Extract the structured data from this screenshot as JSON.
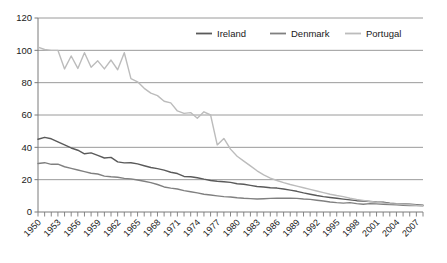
{
  "chart_data": {
    "type": "line",
    "title": "",
    "subtitle": "",
    "xlabel": "",
    "ylabel": "",
    "xlim": [
      1950,
      2008
    ],
    "ylim": [
      0,
      120
    ],
    "yticks": [
      0,
      20,
      40,
      60,
      80,
      100,
      120
    ],
    "ytick_labels": [
      "0",
      "20",
      "40",
      "60",
      "80",
      "100",
      "120"
    ],
    "xticks": [
      1950,
      1953,
      1956,
      1959,
      1962,
      1965,
      1968,
      1971,
      1974,
      1977,
      1980,
      1983,
      1986,
      1989,
      1992,
      1995,
      1998,
      2001,
      2004,
      2007
    ],
    "xtick_labels": [
      "1950",
      "1953",
      "1956",
      "1959",
      "1962",
      "1965",
      "1968",
      "1971",
      "1974",
      "1977",
      "1980",
      "1983",
      "1986",
      "1989",
      "1992",
      "1995",
      "1998",
      "2001",
      "2004",
      "2007"
    ],
    "xtick_minor_step": 1,
    "grid": "horizontal",
    "legend_position": "top-right",
    "x": [
      1950,
      1951,
      1952,
      1953,
      1954,
      1955,
      1956,
      1957,
      1958,
      1959,
      1960,
      1961,
      1962,
      1963,
      1964,
      1965,
      1966,
      1967,
      1968,
      1969,
      1970,
      1971,
      1972,
      1973,
      1974,
      1975,
      1976,
      1977,
      1978,
      1979,
      1980,
      1981,
      1982,
      1983,
      1984,
      1985,
      1986,
      1987,
      1988,
      1989,
      1990,
      1991,
      1992,
      1993,
      1994,
      1995,
      1996,
      1997,
      1998,
      1999,
      2000,
      2001,
      2002,
      2003,
      2004,
      2005,
      2006,
      2007,
      2008
    ],
    "series": [
      {
        "name": "Ireland",
        "color": "#5a5a5a",
        "values": [
          45.0,
          46.2,
          45.3,
          43.4,
          41.5,
          39.6,
          38.2,
          36.0,
          36.6,
          35.0,
          33.4,
          33.8,
          31.0,
          30.4,
          30.5,
          29.8,
          28.6,
          27.5,
          26.8,
          25.9,
          24.6,
          23.8,
          22.0,
          21.8,
          21.2,
          20.3,
          19.5,
          19.0,
          18.7,
          18.3,
          17.5,
          17.2,
          16.5,
          15.8,
          15.5,
          15.0,
          14.8,
          14.2,
          13.5,
          12.8,
          11.8,
          11.0,
          10.2,
          9.5,
          9.0,
          8.5,
          8.0,
          7.5,
          7.0,
          6.8,
          6.5,
          6.2,
          6.0,
          5.5,
          5.2,
          5.0,
          4.8,
          4.5,
          4.2
        ]
      },
      {
        "name": "Denmark",
        "color": "#808080",
        "values": [
          30.0,
          30.5,
          29.5,
          29.6,
          28.0,
          27.0,
          26.0,
          25.0,
          24.0,
          23.5,
          22.2,
          21.8,
          21.5,
          20.8,
          20.5,
          19.8,
          19.0,
          18.2,
          17.0,
          15.5,
          14.8,
          14.2,
          13.2,
          12.5,
          11.8,
          11.0,
          10.5,
          10.0,
          9.5,
          9.3,
          8.8,
          8.5,
          8.3,
          8.0,
          8.2,
          8.4,
          8.5,
          8.6,
          8.5,
          8.4,
          8.0,
          7.8,
          7.3,
          6.8,
          6.2,
          5.8,
          5.5,
          5.8,
          5.2,
          4.8,
          5.2,
          5.0,
          4.8,
          4.6,
          4.4,
          4.2,
          4.0,
          4.0,
          3.9
        ]
      },
      {
        "name": "Portugal",
        "color": "#bcbcbc",
        "values": [
          102.0,
          100.5,
          100.0,
          100.0,
          88.5,
          96.5,
          88.8,
          98.5,
          89.5,
          93.5,
          88.5,
          94.0,
          88.0,
          98.5,
          82.5,
          80.5,
          76.5,
          73.5,
          72.0,
          68.5,
          67.5,
          62.5,
          61.0,
          61.5,
          58.0,
          62.0,
          60.0,
          41.5,
          45.5,
          38.9,
          34.5,
          31.5,
          28.5,
          25.5,
          23.0,
          21.0,
          19.5,
          18.2,
          17.0,
          16.0,
          15.0,
          14.0,
          13.0,
          12.0,
          11.0,
          10.2,
          9.5,
          8.5,
          7.8,
          7.2,
          6.5,
          6.0,
          5.6,
          5.2,
          5.0,
          4.8,
          4.5,
          4.2,
          4.0
        ]
      }
    ],
    "legend": [
      {
        "label": "Ireland",
        "color": "#5a5a5a"
      },
      {
        "label": "Denmark",
        "color": "#808080"
      },
      {
        "label": "Portugal",
        "color": "#bcbcbc"
      }
    ],
    "colors": {
      "axis": "#7a7a7a",
      "grid": "#8f8f8f",
      "text": "#1a1a1a",
      "background": "#ffffff"
    }
  }
}
